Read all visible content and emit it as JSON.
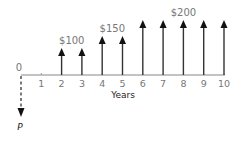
{
  "diagram": {
    "type": "cash-flow-diagram",
    "axis_label": "Years",
    "origin_label": "0",
    "present_value_label": "P",
    "ticks": [
      "1",
      "2",
      "3",
      "4",
      "5",
      "6",
      "7",
      "8",
      "9",
      "10"
    ],
    "cash_flows": [
      {
        "year": 2,
        "amount": 100
      },
      {
        "year": 3,
        "amount": 100
      },
      {
        "year": 4,
        "amount": 150
      },
      {
        "year": 5,
        "amount": 150
      },
      {
        "year": 6,
        "amount": 200
      },
      {
        "year": 7,
        "amount": 200
      },
      {
        "year": 8,
        "amount": 200
      },
      {
        "year": 9,
        "amount": 200
      },
      {
        "year": 10,
        "amount": 200
      }
    ],
    "group_labels": [
      {
        "text": "$100",
        "years": [
          2,
          3
        ]
      },
      {
        "text": "$150",
        "years": [
          4,
          5
        ]
      },
      {
        "text": "$200",
        "years": [
          6,
          7,
          8,
          9,
          10
        ]
      }
    ]
  }
}
